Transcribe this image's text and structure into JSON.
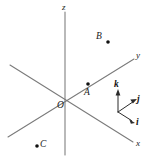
{
  "figure": {
    "background_color": "#ffffff",
    "axis_color": "#7a7a7a",
    "point_color": "#111111",
    "unit_vector_color": "#2b2b2b",
    "width": 147,
    "height": 162
  },
  "axes": [
    {
      "id": "z",
      "label": "z",
      "label_x": 62,
      "label_y": 3,
      "x1": 65,
      "y1": 12,
      "x2": 65,
      "y2": 155
    },
    {
      "id": "y",
      "label": "y",
      "label_x": 136,
      "label_y": 51,
      "x1": 8,
      "y1": 137,
      "x2": 134,
      "y2": 59
    },
    {
      "id": "x",
      "label": "x",
      "label_x": 136,
      "label_y": 139,
      "x1": 10,
      "y1": 65,
      "x2": 133,
      "y2": 142
    }
  ],
  "origin": {
    "label": "O",
    "x": 65,
    "y": 99,
    "label_x": 57,
    "label_y": 101
  },
  "points": [
    {
      "id": "A",
      "label": "A",
      "dot_x": 88,
      "dot_y": 84,
      "label_x": 84,
      "label_y": 88,
      "radius": 1.8,
      "on_axis": "y"
    },
    {
      "id": "B",
      "label": "B",
      "dot_x": 108,
      "dot_y": 42,
      "label_x": 96,
      "label_y": 32,
      "radius": 1.8,
      "on_axis": ""
    },
    {
      "id": "C",
      "label": "C",
      "dot_x": 37,
      "dot_y": 146,
      "label_x": 40,
      "label_y": 140,
      "radius": 1.8,
      "on_axis": ""
    }
  ],
  "unit_vectors": {
    "origin_x": 118,
    "origin_y": 112,
    "items": [
      {
        "id": "k",
        "label": "k",
        "tip_x": 118,
        "tip_y": 91,
        "label_x": 114,
        "label_y": 80
      },
      {
        "id": "j",
        "label": "j",
        "tip_x": 136,
        "tip_y": 100,
        "label_x": 137,
        "label_y": 95
      },
      {
        "id": "i",
        "label": "i",
        "tip_x": 134,
        "tip_y": 122,
        "label_x": 136,
        "label_y": 118
      }
    ]
  }
}
